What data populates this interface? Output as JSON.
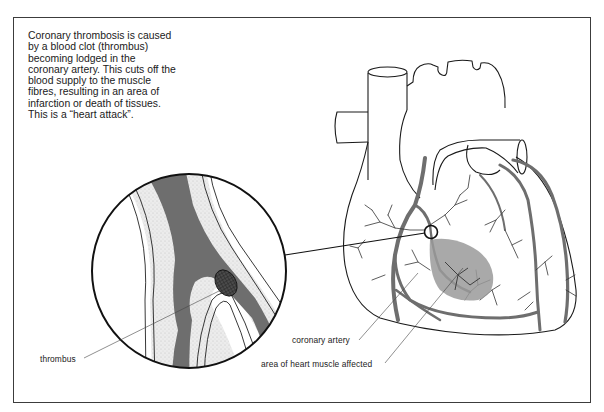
{
  "figure": {
    "caption": "Coronary thrombosis is caused by a blood clot (thrombus) becoming lodged in the coronary artery. This cuts off the blood supply to the muscle fibres, resulting in an area of infarction or death of tissues. This is a “heart attack”.",
    "labels": {
      "thrombus": "thrombus",
      "coronary_artery": "coronary artery",
      "affected_area": "area of heart muscle affected"
    },
    "colors": {
      "outline": "#1a1a1a",
      "artery": "#6e6e6e",
      "infarct": "#9a9a9a",
      "vessel_wall": "#ededed",
      "thrombus": "#3a3a3a"
    }
  }
}
